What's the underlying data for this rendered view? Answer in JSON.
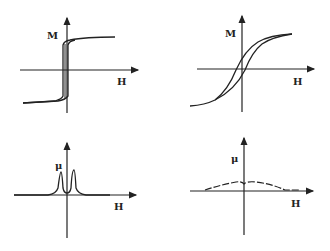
{
  "panels": [
    {
      "id": "top-left",
      "y_label": "M",
      "x_label": "H",
      "description": "square hysteresis loop (hard/narrow switching)"
    },
    {
      "id": "top-right",
      "y_label": "M",
      "x_label": "H",
      "description": "sheared hysteresis loop"
    },
    {
      "id": "bottom-left",
      "y_label": "μ",
      "x_label": "H",
      "description": "sharp permeability peaks near H=0"
    },
    {
      "id": "bottom-right",
      "y_label": "μ",
      "x_label": "H",
      "description": "broad flat permeability curve"
    }
  ],
  "colors": {
    "line": "#222222",
    "background": "#ffffff"
  }
}
